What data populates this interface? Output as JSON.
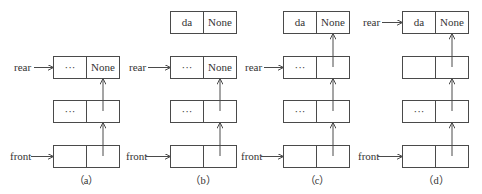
{
  "figure": {
    "panels": [
      {
        "caption": "（a）",
        "nodes": [
          {
            "role": "rear",
            "data": "···",
            "next": "None"
          },
          {
            "role": "middle",
            "data": "···",
            "next": ""
          },
          {
            "role": "front",
            "data": "",
            "next": ""
          }
        ],
        "pointers": {
          "rear": "rear",
          "front": "front"
        }
      },
      {
        "caption": "（b）",
        "nodes": [
          {
            "role": "new",
            "data": "da",
            "next": "None"
          },
          {
            "role": "rear",
            "data": "···",
            "next": "None"
          },
          {
            "role": "middle",
            "data": "···",
            "next": ""
          },
          {
            "role": "front",
            "data": "",
            "next": ""
          }
        ],
        "pointers": {
          "rear": "rear",
          "front": "front"
        }
      },
      {
        "caption": "（c）",
        "nodes": [
          {
            "role": "new",
            "data": "da",
            "next": "None"
          },
          {
            "role": "rear",
            "data": "···",
            "next": ""
          },
          {
            "role": "middle",
            "data": "···",
            "next": ""
          },
          {
            "role": "front",
            "data": "",
            "next": ""
          }
        ],
        "pointers": {
          "rear": "rear",
          "front": "front"
        }
      },
      {
        "caption": "（d）",
        "nodes": [
          {
            "role": "rear",
            "data": "da",
            "next": "None"
          },
          {
            "role": "middle",
            "data": "",
            "next": ""
          },
          {
            "role": "middle",
            "data": "···",
            "next": ""
          },
          {
            "role": "front",
            "data": "",
            "next": ""
          }
        ],
        "pointers": {
          "rear": "rear",
          "front": "front"
        }
      }
    ]
  },
  "colors": {
    "line": "#4a4a4a",
    "text": "#333333",
    "background": "#ffffff"
  }
}
